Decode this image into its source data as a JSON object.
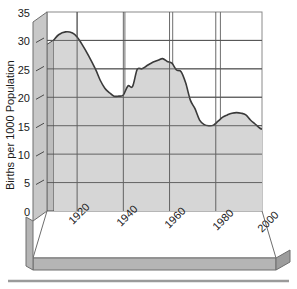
{
  "chart_data": {
    "type": "area",
    "title": "",
    "xlabel": "",
    "ylabel": "Births per 1000 Population",
    "xlim": [
      1910,
      2000
    ],
    "ylim": [
      0,
      35
    ],
    "grid": true,
    "legend": "none",
    "style": "3d-area",
    "x_tick_labels": [
      "1920",
      "1940",
      "1960",
      "1980",
      "2000"
    ],
    "x_ticks": [
      1920,
      1940,
      1960,
      1980,
      2000
    ],
    "y_tick_labels": [
      "0",
      "5",
      "10",
      "15",
      "20",
      "25",
      "30",
      "35"
    ],
    "y_ticks": [
      0,
      5,
      10,
      15,
      20,
      25,
      30,
      35
    ],
    "series": [
      {
        "name": "Births per 1000 Population",
        "x": [
          1910,
          1912,
          1915,
          1918,
          1920,
          1922,
          1925,
          1928,
          1930,
          1932,
          1934,
          1936,
          1938,
          1940,
          1942,
          1944,
          1946,
          1948,
          1950,
          1952,
          1955,
          1957,
          1959,
          1961,
          1963,
          1965,
          1967,
          1969,
          1971,
          1973,
          1975,
          1977,
          1979,
          1981,
          1983,
          1985,
          1987,
          1989,
          1991,
          1993,
          1995,
          1997,
          1999,
          2000
        ],
        "values": [
          30.1,
          31.0,
          31.5,
          31.3,
          30.6,
          29.4,
          27.3,
          24.9,
          23.0,
          21.6,
          20.8,
          20.2,
          20.2,
          20.4,
          22.0,
          21.9,
          24.9,
          25.0,
          25.5,
          26.0,
          26.5,
          26.8,
          26.3,
          26.0,
          24.8,
          24.5,
          22.5,
          19.5,
          18.0,
          16.0,
          15.2,
          15.0,
          15.1,
          15.8,
          16.5,
          16.9,
          17.2,
          17.3,
          17.2,
          16.9,
          16.0,
          15.3,
          14.6,
          14.4
        ]
      }
    ]
  },
  "axes": {
    "y_title": "Births per 1000 Population"
  },
  "colors": {
    "area_fill": "#d4d4d4",
    "area_line": "#3a3a3a",
    "wall_fill": "#ffffff",
    "floor_fill": "#ffffff",
    "side_fill": "#bfbfbf",
    "grid_line": "#4a4a4a",
    "frame_line": "#7a7a7a",
    "text": "#1a1a1a",
    "rule": "#9a9a9a"
  }
}
